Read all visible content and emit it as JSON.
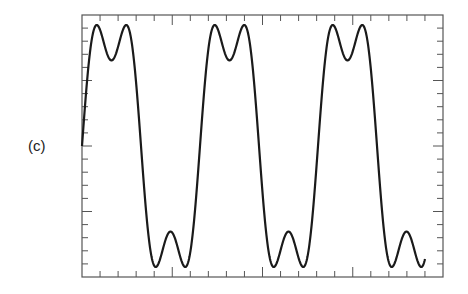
{
  "figure": {
    "panel_label": "(c)"
  },
  "chart_data": {
    "type": "line",
    "title": "",
    "xlabel": "",
    "ylabel": "",
    "grid": false,
    "legend": null,
    "frame": {
      "x0": 82,
      "y0": 15,
      "x1": 443,
      "y1": 277
    },
    "x_ticks": {
      "count": 20,
      "major_every": 5
    },
    "y_ticks": {
      "count": 20,
      "major_every": 5
    },
    "series": [
      {
        "name": "sin(t) + sin(3t)/3",
        "color": "#1a1a1a",
        "period_px": 118,
        "x_start_px": 82,
        "x_end_px": 425,
        "center_y_px": 146,
        "peak_amplitude_px": 121,
        "harmonics": [
          1,
          3
        ],
        "coefficients": [
          1,
          0.3333
        ],
        "cycles_shown": 2.9,
        "normalized_extrema": {
          "max": 0.943,
          "local_min_between_peaks": 0.667,
          "min": -0.943,
          "local_max_between_troughs": -0.667
        }
      }
    ],
    "ylim": [
      -1.0,
      1.0
    ],
    "xlim": [
      0,
      3.06
    ]
  }
}
